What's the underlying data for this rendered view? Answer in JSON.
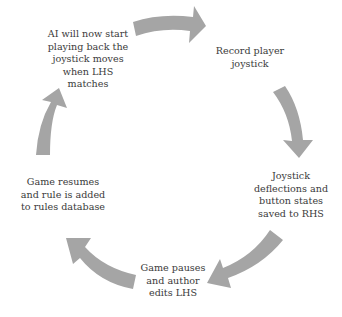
{
  "diagram": {
    "type": "cycle",
    "arrow_color": "#a5a5a5",
    "text_color": "#3a3a3a",
    "steps": [
      {
        "id": "record",
        "lines": [
          "Record player",
          "joystick"
        ]
      },
      {
        "id": "saved",
        "lines": [
          "Joystick",
          "deflections and",
          "button states",
          "saved to RHS"
        ]
      },
      {
        "id": "pause",
        "lines": [
          "Game pauses",
          "and author",
          "edits LHS"
        ]
      },
      {
        "id": "resume",
        "lines": [
          "Game resumes",
          "and rule is added",
          "to rules database"
        ]
      },
      {
        "id": "playback",
        "lines": [
          "AI will now start",
          "playing back the",
          "joystick moves",
          "when LHS",
          "matches"
        ]
      }
    ],
    "flow": [
      "playback -> record",
      "record -> saved",
      "saved -> pause",
      "pause -> resume",
      "resume -> playback"
    ]
  }
}
